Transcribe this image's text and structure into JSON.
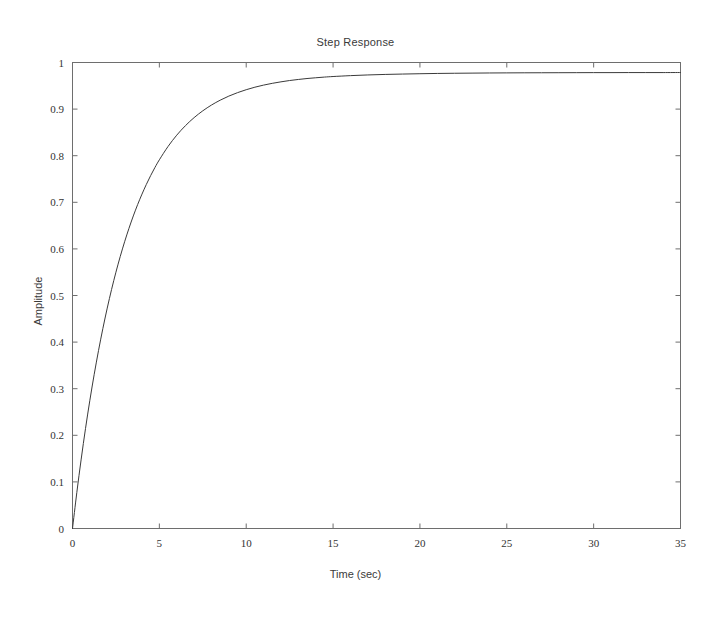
{
  "chart_data": {
    "type": "line",
    "title": "Step Response",
    "xlabel": "Time (sec)",
    "ylabel": "Amplitude",
    "xlim": [
      0,
      35
    ],
    "ylim": [
      0,
      1
    ],
    "xticks": [
      0,
      5,
      10,
      15,
      20,
      25,
      30,
      35
    ],
    "xtick_labels": [
      "0",
      "5",
      "10",
      "15",
      "20",
      "25",
      "30",
      "35"
    ],
    "yticks": [
      0,
      0.1,
      0.2,
      0.3,
      0.4,
      0.5,
      0.6,
      0.7,
      0.8,
      0.9,
      1
    ],
    "ytick_labels": [
      "0",
      "0.1",
      "0.2",
      "0.3",
      "0.4",
      "0.5",
      "0.6",
      "0.7",
      "0.8",
      "0.9",
      "1"
    ],
    "grid": false,
    "legend": null,
    "line_color": "#3a3a3a",
    "line_width": 1,
    "series": [
      {
        "name": "step response",
        "x": [
          0,
          0.25,
          0.5,
          0.75,
          1,
          1.25,
          1.5,
          1.75,
          2,
          2.25,
          2.5,
          2.75,
          3,
          3.25,
          3.5,
          3.75,
          4,
          4.25,
          4.5,
          4.75,
          5,
          5.5,
          6,
          6.5,
          7,
          7.5,
          8,
          8.5,
          9,
          9.5,
          10,
          10.5,
          11,
          11.5,
          12,
          12.5,
          13,
          13.5,
          14,
          14.5,
          15,
          16,
          17,
          18,
          19,
          20,
          21,
          22,
          23,
          24,
          25,
          26,
          27,
          28,
          29,
          30,
          31,
          32,
          33,
          34,
          35
        ],
        "y": [
          0,
          0.0775,
          0.1489,
          0.2147,
          0.2752,
          0.3309,
          0.3822,
          0.4295,
          0.473,
          0.5131,
          0.55,
          0.584,
          0.6153,
          0.6441,
          0.6707,
          0.6951,
          0.7176,
          0.7383,
          0.7574,
          0.775,
          0.7912,
          0.8198,
          0.844,
          0.8644,
          0.8817,
          0.8963,
          0.9087,
          0.9191,
          0.9279,
          0.9353,
          0.9416,
          0.947,
          0.9515,
          0.9553,
          0.9585,
          0.9613,
          0.9636,
          0.9656,
          0.9672,
          0.9687,
          0.9699,
          0.9718,
          0.9733,
          0.9744,
          0.9752,
          0.9759,
          0.9765,
          0.9769,
          0.9772,
          0.9775,
          0.9777,
          0.9779,
          0.978,
          0.9781,
          0.9782,
          0.9783,
          0.9783,
          0.9784,
          0.9784,
          0.9784,
          0.9785
        ]
      }
    ],
    "annotations": []
  }
}
